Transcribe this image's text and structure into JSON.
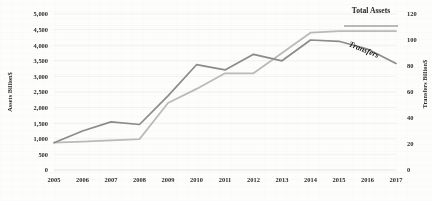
{
  "chart_data": {
    "type": "line",
    "title": "",
    "xlabel": "",
    "categories": [
      2005,
      2006,
      2007,
      2008,
      2009,
      2010,
      2011,
      2012,
      2013,
      2014,
      2015,
      2016,
      2017
    ],
    "grid": "horizontal",
    "legend_position": "inline-annotations",
    "axes": {
      "left": {
        "title": "Assets Billion$",
        "ylim": [
          0,
          5000
        ],
        "tick_step": 500,
        "ticks": [
          "0",
          "500",
          "1,000",
          "1,500",
          "2,000",
          "2,500",
          "3,000",
          "3,500",
          "4,000",
          "4,500",
          "5,000"
        ]
      },
      "right": {
        "title": "Transfers Billion$",
        "ylim": [
          0,
          120
        ],
        "tick_step": 20,
        "ticks": [
          "0",
          "20",
          "40",
          "60",
          "80",
          "100",
          "120"
        ]
      }
    },
    "series": [
      {
        "name": "Total Assets",
        "axis": "left",
        "color": "#b9bbb8",
        "label_text": "Total Assets",
        "values": [
          880,
          910,
          950,
          990,
          2150,
          2600,
          3100,
          3100,
          3750,
          4400,
          4450,
          4450,
          4450
        ]
      },
      {
        "name": "Transfers",
        "axis": "right",
        "color": "#8b8d8a",
        "label_text": "Transfers",
        "values": [
          21,
          30,
          37,
          35,
          57,
          81,
          77,
          89,
          84,
          100,
          99,
          93,
          82
        ]
      }
    ]
  }
}
